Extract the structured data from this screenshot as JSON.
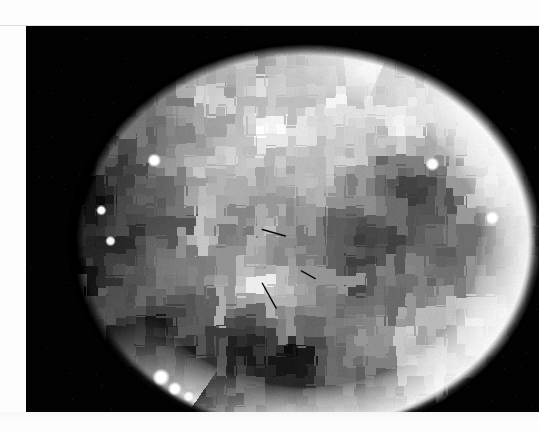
{
  "page": {
    "width": 539,
    "height": 431,
    "background_color": "#fdfdfd",
    "media_type": "scanned-figure"
  },
  "figure": {
    "name": "pixelated-planetary-disk",
    "frame": {
      "x": 26,
      "y": 26,
      "width": 513,
      "height": 386
    },
    "background_color": "#000000",
    "caption": ""
  },
  "chart_data": {
    "type": "heatmap",
    "title": "",
    "subtitle": "",
    "xlabel": "",
    "ylabel": "",
    "colormap": "grayscale",
    "grid": false,
    "legend_position": "none",
    "block_size_px": 10,
    "value_range": [
      0,
      255
    ],
    "disk": {
      "center_x": 280,
      "center_y": 215,
      "radius_x": 230,
      "radius_y": 192,
      "limb_angle_start_deg": -70,
      "limb_angle_end_deg": 120,
      "limb_brightness": 252,
      "limb_thickness_px": 46,
      "terminator_softness_px": 14
    },
    "surface_levels": [
      18,
      42,
      64,
      86,
      104,
      126,
      148,
      168,
      188,
      206,
      224,
      240
    ],
    "regions": [
      {
        "name": "north-bright-cap",
        "cx": 0.46,
        "cy": 0.18,
        "rx": 0.42,
        "ry": 0.24,
        "value": 232
      },
      {
        "name": "northwest-mottled-band",
        "cx": 0.22,
        "cy": 0.3,
        "rx": 0.26,
        "ry": 0.22,
        "value": 176
      },
      {
        "name": "west-limb-shadow",
        "cx": 0.06,
        "cy": 0.46,
        "rx": 0.18,
        "ry": 0.3,
        "value": 72
      },
      {
        "name": "equatorial-midtone-belt",
        "cx": 0.4,
        "cy": 0.5,
        "rx": 0.38,
        "ry": 0.18,
        "value": 158
      },
      {
        "name": "central-bright-patch",
        "cx": 0.4,
        "cy": 0.6,
        "rx": 0.1,
        "ry": 0.08,
        "value": 238
      },
      {
        "name": "southeast-dark-maria",
        "cx": 0.66,
        "cy": 0.58,
        "rx": 0.22,
        "ry": 0.2,
        "value": 52
      },
      {
        "name": "east-dark-spur",
        "cx": 0.72,
        "cy": 0.34,
        "rx": 0.14,
        "ry": 0.12,
        "value": 76
      },
      {
        "name": "south-dark-rim",
        "cx": 0.4,
        "cy": 0.82,
        "rx": 0.28,
        "ry": 0.14,
        "value": 46
      },
      {
        "name": "southwest-shadow-wedge",
        "cx": 0.2,
        "cy": 0.76,
        "rx": 0.18,
        "ry": 0.16,
        "value": 62
      },
      {
        "name": "southeast-bright-crescent-inner",
        "cx": 0.8,
        "cy": 0.74,
        "rx": 0.18,
        "ry": 0.18,
        "value": 216
      }
    ],
    "point_features": [
      {
        "name": "bright-speck-nw",
        "x": 0.17,
        "y": 0.29,
        "r": 4,
        "value": 255
      },
      {
        "name": "bright-speck-w-1",
        "x": 0.055,
        "y": 0.42,
        "r": 3,
        "value": 250
      },
      {
        "name": "bright-speck-w-2",
        "x": 0.075,
        "y": 0.5,
        "r": 3,
        "value": 244
      },
      {
        "name": "bright-speck-ne",
        "x": 0.775,
        "y": 0.3,
        "r": 4,
        "value": 252
      },
      {
        "name": "bright-speck-e",
        "x": 0.905,
        "y": 0.44,
        "r": 4,
        "value": 255
      },
      {
        "name": "bright-dot-sw-1",
        "x": 0.185,
        "y": 0.855,
        "r": 5,
        "value": 255
      },
      {
        "name": "bright-dot-sw-2",
        "x": 0.215,
        "y": 0.885,
        "r": 4,
        "value": 255
      },
      {
        "name": "bright-dot-sw-3",
        "x": 0.245,
        "y": 0.905,
        "r": 3,
        "value": 250
      },
      {
        "name": "bright-dot-bottom",
        "x": 0.515,
        "y": 0.985,
        "r": 4,
        "value": 255
      }
    ],
    "scratch_marks": [
      {
        "name": "scratch-upper",
        "x1": 0.405,
        "y1": 0.47,
        "x2": 0.455,
        "y2": 0.487,
        "value": 8
      },
      {
        "name": "scratch-mid",
        "x1": 0.49,
        "y1": 0.578,
        "x2": 0.52,
        "y2": 0.598,
        "value": 10
      },
      {
        "name": "scratch-lower",
        "x1": 0.405,
        "y1": 0.61,
        "x2": 0.435,
        "y2": 0.675,
        "value": 6
      }
    ],
    "noise": {
      "amplitude": 16,
      "seed": 20240717
    }
  },
  "artifacts": {
    "top_scan_line_y": 25,
    "bottom_haze_y": 412
  }
}
